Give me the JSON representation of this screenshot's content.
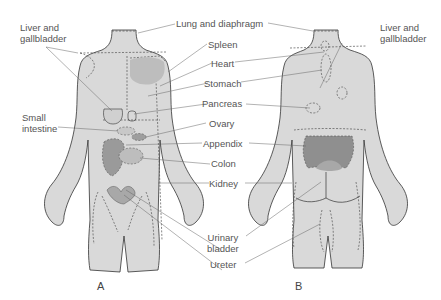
{
  "figure": {
    "panels": [
      {
        "id": "A",
        "label": "A",
        "view": "anterior"
      },
      {
        "id": "B",
        "label": "B",
        "view": "posterior"
      }
    ],
    "colors": {
      "body_fill": "#d9d9d9",
      "body_outline": "#333333",
      "organ_light": "#bdbdbd",
      "organ_dark": "#8f8f8f",
      "leader_line": "#666666",
      "text": "#555555"
    }
  },
  "labels": {
    "liver_left": "Liver and\ngallbladder",
    "liver_left_l1": "Liver and",
    "liver_left_l2": "gallbladder",
    "liver_right_l1": "Liver and",
    "liver_right_l2": "gallbladder",
    "lung": "Lung and diaphragm",
    "spleen": "Spleen",
    "heart": "Heart",
    "stomach": "Stomach",
    "pancreas": "Pancreas",
    "ovary": "Ovary",
    "appendix": "Appendix",
    "colon": "Colon",
    "kidney": "Kidney",
    "small_intestine_l1": "Small",
    "small_intestine_l2": "intestine",
    "urinary_bladder_l1": "Urinary",
    "urinary_bladder_l2": "bladder",
    "ureter": "Ureter",
    "panel_a": "A",
    "panel_b": "B"
  }
}
